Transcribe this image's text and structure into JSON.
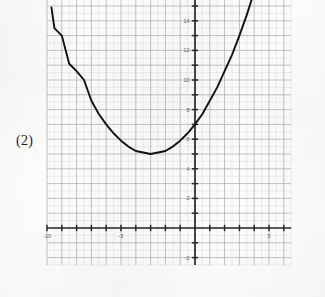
{
  "figure": {
    "label": "(2)",
    "background_color": "#fcfcfb",
    "grid": {
      "major_color": "#a9a9ad",
      "minor_color": "#d8d8dc",
      "minor_per_major": 2,
      "visible": true
    },
    "axis_color": "#2a2a2a",
    "curve_color": "#111111"
  },
  "chart_data": {
    "type": "line",
    "title": "",
    "xlabel": "",
    "ylabel": "",
    "curve_equation": "y = (2/9)(x + 3)^2 + 5",
    "vertex": [
      -3,
      5
    ],
    "y_intercept": 7,
    "xlim": [
      -10,
      6.5
    ],
    "ylim": [
      -2.5,
      15.5
    ],
    "xticks": [
      -10,
      -9,
      -8,
      -7,
      -6,
      -5,
      -4,
      -3,
      -2,
      -1,
      0,
      1,
      2,
      3,
      4,
      5,
      6
    ],
    "yticks": [
      -2,
      -1,
      0,
      1,
      2,
      3,
      4,
      5,
      6,
      7,
      8,
      9,
      10,
      11,
      12,
      13,
      14,
      15
    ],
    "xtick_labels": [
      {
        "value": -10,
        "text": "-10"
      },
      {
        "value": -5,
        "text": "-5"
      },
      {
        "value": 5,
        "text": "5"
      }
    ],
    "ytick_labels": [
      {
        "value": 14,
        "text": "14"
      },
      {
        "value": 12,
        "text": "12"
      },
      {
        "value": 10,
        "text": "10"
      },
      {
        "value": 8,
        "text": "8"
      },
      {
        "value": 6,
        "text": "6"
      },
      {
        "value": 4,
        "text": "4"
      },
      {
        "value": 2,
        "text": "2"
      },
      {
        "value": -2,
        "text": "-2"
      }
    ],
    "series": [
      {
        "name": "parabola",
        "points": [
          [
            -9.7,
            14.9
          ],
          [
            -9.5,
            13.5
          ],
          [
            -9.0,
            13.0
          ],
          [
            -8.5,
            11.1
          ],
          [
            -8.0,
            10.6
          ],
          [
            -7.5,
            10.0
          ],
          [
            -7.0,
            8.6
          ],
          [
            -6.5,
            7.7
          ],
          [
            -6.0,
            7.0
          ],
          [
            -5.5,
            6.4
          ],
          [
            -5.0,
            5.9
          ],
          [
            -4.5,
            5.5
          ],
          [
            -4.0,
            5.2
          ],
          [
            -3.5,
            5.1
          ],
          [
            -3.0,
            5.0
          ],
          [
            -2.5,
            5.1
          ],
          [
            -2.0,
            5.2
          ],
          [
            -1.5,
            5.5
          ],
          [
            -1.0,
            5.9
          ],
          [
            -0.5,
            6.4
          ],
          [
            0.0,
            7.0
          ],
          [
            0.5,
            7.7
          ],
          [
            1.0,
            8.6
          ],
          [
            1.5,
            9.5
          ],
          [
            2.0,
            10.6
          ],
          [
            2.5,
            11.7
          ],
          [
            3.0,
            13.0
          ],
          [
            3.5,
            14.4
          ],
          [
            3.85,
            15.5
          ]
        ]
      }
    ],
    "grid": true,
    "legend": null
  }
}
